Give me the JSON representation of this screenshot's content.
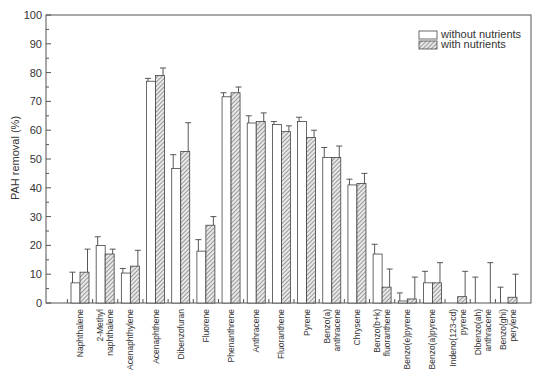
{
  "chart_data": {
    "type": "bar",
    "title": "",
    "xlabel": "",
    "ylabel": "PAH removal (%)",
    "ylim": [
      0,
      100
    ],
    "yticks": [
      0,
      10,
      20,
      30,
      40,
      50,
      60,
      70,
      80,
      90,
      100
    ],
    "grid": false,
    "legend_position": "top-right",
    "categories": [
      [
        "Naphthalene"
      ],
      [
        "2-Methyl",
        "naphthalene"
      ],
      [
        "Acenaphthylene"
      ],
      [
        "Acenaphthene"
      ],
      [
        "Dibenzofuran"
      ],
      [
        "Fluorene"
      ],
      [
        "Phenanthrene"
      ],
      [
        "Anthracene"
      ],
      [
        "Fluoranthene"
      ],
      [
        "Pyrene"
      ],
      [
        "Benzo(a)",
        "anthracene"
      ],
      [
        "Chrysene"
      ],
      [
        "Benzo(b+k)",
        "fluoranthene"
      ],
      [
        "Benzo(e)pyrene"
      ],
      [
        "Benzo(a)pyrene"
      ],
      [
        "Indeno(123-cd)",
        "pyrene"
      ],
      [
        "Dibenzo(ah)",
        "anthracene"
      ],
      [
        "Benzo(ghi)",
        "perylene"
      ]
    ],
    "series": [
      {
        "name": "without nutrients",
        "pattern": "open",
        "values": [
          7,
          20,
          10.4,
          77,
          46.7,
          18,
          71.6,
          62.5,
          62,
          63,
          50.5,
          41,
          17,
          0.7,
          7,
          0,
          0,
          0
        ],
        "error": [
          3.7,
          3,
          1.6,
          1,
          4.8,
          4,
          1.4,
          2.5,
          1,
          1.5,
          3.5,
          2,
          3.4,
          2.8,
          4,
          0,
          9,
          5.5
        ]
      },
      {
        "name": "with nutrients",
        "pattern": "hatched",
        "values": [
          10.7,
          17,
          12.8,
          79,
          52.6,
          27,
          73,
          63,
          59.5,
          57.5,
          50.5,
          41.5,
          5.5,
          1.4,
          7,
          2.2,
          0,
          2
        ],
        "error": [
          8,
          1.7,
          5.5,
          2.6,
          10,
          3,
          2,
          3,
          2,
          2.5,
          4,
          3.5,
          6.3,
          7.6,
          7,
          8.8,
          14,
          8
        ]
      }
    ]
  }
}
